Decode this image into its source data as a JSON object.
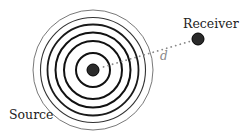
{
  "diagram": {
    "source": {
      "label": "Source",
      "center": [
        93,
        70
      ],
      "dot_radius": 6,
      "color": "#2a2a2a"
    },
    "waves": {
      "rings": [
        {
          "r": 17,
          "width": 2.0,
          "color": "#111111"
        },
        {
          "r": 29,
          "width": 2.0,
          "color": "#111111"
        },
        {
          "r": 37.5,
          "width": 2.0,
          "color": "#111111"
        },
        {
          "r": 45.5,
          "width": 1.8,
          "color": "#1a1a1a"
        },
        {
          "r": 52.5,
          "width": 1.1,
          "color": "#333333"
        },
        {
          "r": 60,
          "width": 0.8,
          "color": "#555555"
        }
      ]
    },
    "receiver": {
      "label": "Receiver",
      "center": [
        198,
        39
      ],
      "dot_radius": 6,
      "color": "#2a2a2a"
    },
    "distance": {
      "label": "d",
      "line_color": "#888888",
      "label_color": "#888888"
    }
  }
}
